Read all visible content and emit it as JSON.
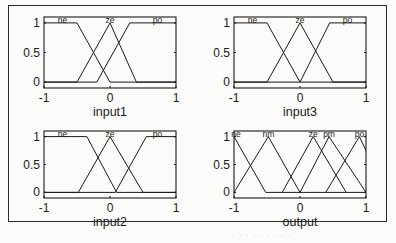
{
  "chart_data": [
    {
      "type": "line",
      "title": "",
      "xlabel": "input1",
      "ylabel": "",
      "xlim": [
        -1,
        1
      ],
      "ylim": [
        -0.1,
        1.1
      ],
      "xticks": [
        "-1",
        "0",
        "1"
      ],
      "yticks": [
        "0",
        "0.5",
        "1"
      ],
      "series": [
        {
          "name": "ne",
          "shape": "trapezoid",
          "points": [
            [
              -1,
              1
            ],
            [
              -0.5,
              1
            ],
            [
              0,
              0
            ],
            [
              1,
              0
            ]
          ]
        },
        {
          "name": "ze",
          "shape": "triangle",
          "points": [
            [
              -1,
              0
            ],
            [
              -0.5,
              0
            ],
            [
              0,
              1
            ],
            [
              0.4,
              0
            ],
            [
              1,
              0
            ]
          ]
        },
        {
          "name": "po",
          "shape": "trapezoid",
          "points": [
            [
              -1,
              0
            ],
            [
              -0.2,
              0
            ],
            [
              0.3,
              1
            ],
            [
              1,
              1
            ]
          ]
        }
      ]
    },
    {
      "type": "line",
      "title": "",
      "xlabel": "input3",
      "ylabel": "",
      "xlim": [
        -1,
        1
      ],
      "ylim": [
        -0.1,
        1.1
      ],
      "xticks": [
        "-1",
        "0",
        "1"
      ],
      "yticks": [
        "0",
        "0.5",
        "1"
      ],
      "series": [
        {
          "name": "ne",
          "shape": "trapezoid",
          "points": [
            [
              -1,
              1
            ],
            [
              -0.5,
              1
            ],
            [
              0,
              0
            ],
            [
              1,
              0
            ]
          ]
        },
        {
          "name": "ze",
          "shape": "triangle",
          "points": [
            [
              -1,
              0
            ],
            [
              -0.5,
              0
            ],
            [
              0,
              1
            ],
            [
              0.5,
              0
            ],
            [
              1,
              0
            ]
          ]
        },
        {
          "name": "po",
          "shape": "trapezoid",
          "points": [
            [
              -1,
              0
            ],
            [
              0,
              0
            ],
            [
              0.45,
              1
            ],
            [
              1,
              1
            ]
          ]
        }
      ]
    },
    {
      "type": "line",
      "title": "",
      "xlabel": "input2",
      "ylabel": "",
      "xlim": [
        -1,
        1
      ],
      "ylim": [
        -0.1,
        1.1
      ],
      "xticks": [
        "-1",
        "0",
        "1"
      ],
      "yticks": [
        "0",
        "0.5",
        "1"
      ],
      "series": [
        {
          "name": "ne",
          "shape": "trapezoid",
          "points": [
            [
              -1,
              1
            ],
            [
              -0.35,
              1
            ],
            [
              0.1,
              0
            ],
            [
              1,
              0
            ]
          ]
        },
        {
          "name": "ze",
          "shape": "triangle",
          "points": [
            [
              -1,
              0
            ],
            [
              -0.48,
              0
            ],
            [
              0,
              1
            ],
            [
              0.5,
              0
            ],
            [
              1,
              0
            ]
          ]
        },
        {
          "name": "po",
          "shape": "trapezoid",
          "points": [
            [
              -1,
              0
            ],
            [
              0.08,
              0
            ],
            [
              0.55,
              1
            ],
            [
              1,
              1
            ]
          ]
        }
      ]
    },
    {
      "type": "line",
      "title": "",
      "xlabel": "output",
      "ylabel": "",
      "xlim": [
        -1,
        1
      ],
      "ylim": [
        -0.1,
        1.1
      ],
      "xticks": [
        "-1",
        "0",
        "1"
      ],
      "yticks": [
        "0",
        "0.5",
        "1"
      ],
      "series": [
        {
          "name": "ne",
          "shape": "triangle",
          "points": [
            [
              -1,
              1
            ],
            [
              -0.52,
              0
            ],
            [
              1,
              0
            ]
          ]
        },
        {
          "name": "nm",
          "shape": "triangle",
          "points": [
            [
              -1,
              0
            ],
            [
              -0.48,
              1
            ],
            [
              0,
              0
            ]
          ]
        },
        {
          "name": "ze",
          "shape": "triangle",
          "points": [
            [
              -0.27,
              0
            ],
            [
              0.2,
              1
            ],
            [
              0.7,
              0
            ]
          ]
        },
        {
          "name": "pm",
          "shape": "triangle",
          "points": [
            [
              0,
              0
            ],
            [
              0.44,
              1
            ],
            [
              1,
              0
            ]
          ]
        },
        {
          "name": "po",
          "shape": "triangle",
          "points": [
            [
              0.39,
              0
            ],
            [
              0.9,
              1
            ],
            [
              1.3,
              0
            ]
          ]
        }
      ]
    }
  ],
  "caption_fragment": "· · · · ·  · · · ·"
}
